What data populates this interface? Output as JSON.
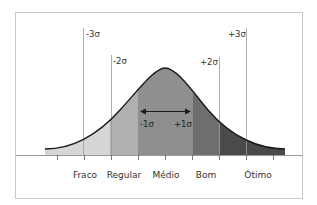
{
  "diagram": {
    "title": "",
    "sigma_labels": {
      "minus3": "-3σ",
      "minus2": "-2σ",
      "minus1": "-1σ",
      "plus1": "+1σ",
      "plus2": "+2σ",
      "plus3": "+3σ"
    },
    "categories": [
      "Fraco",
      "Regular",
      "Médio",
      "Bom",
      "Ótimo"
    ],
    "colors": {
      "frame": "#c8c8c8",
      "band_fraco": "#d6d6d6",
      "band_regular": "#b0b0b0",
      "band_medio": "#8f8f8f",
      "band_bom": "#6e6e6e",
      "band_otimo": "#4a4a4a",
      "curve": "#1a1a1a",
      "guide_line": "#9a9a9a",
      "axis": "#9a9a9a",
      "text": "#333333"
    }
  }
}
